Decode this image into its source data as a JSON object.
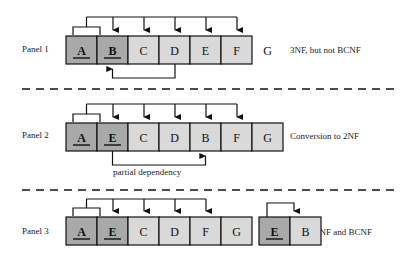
{
  "figure": {
    "colors": {
      "key_cell_fill": "#a9a9a9",
      "nonkey_cell_fill": "#d9d9d9",
      "stroke": "#111111",
      "background": "#ffffff",
      "dashed_separator": "#111111"
    }
  },
  "panels": [
    {
      "id": "panel-1",
      "label": "Panel 1",
      "note": "3NF, but not BCNF",
      "tables": [
        {
          "id": "panel1-table",
          "cells": [
            {
              "text": "A",
              "key": true,
              "underline": true
            },
            {
              "text": "B",
              "key": true,
              "underline": true
            },
            {
              "text": "C",
              "key": false,
              "underline": false
            },
            {
              "text": "D",
              "key": false,
              "underline": false
            },
            {
              "text": "E",
              "key": false,
              "underline": false
            },
            {
              "text": "F",
              "key": false,
              "underline": false
            },
            {
              "text": "G",
              "key": false,
              "underline": false
            }
          ]
        }
      ],
      "dependencies": [
        {
          "from": [
            "A",
            "B"
          ],
          "to": [
            "C",
            "D",
            "E",
            "F",
            "G"
          ],
          "side": "top",
          "kind": "composite-key-determines-nonkey"
        },
        {
          "from": [
            "E"
          ],
          "to": [
            "B"
          ],
          "side": "bottom",
          "kind": "transitive-dependency",
          "caption": ""
        }
      ]
    },
    {
      "id": "panel-2",
      "label": "Panel 2",
      "note": "Conversion to 2NF",
      "tables": [
        {
          "id": "panel2-table",
          "cells": [
            {
              "text": "A",
              "key": true,
              "underline": true
            },
            {
              "text": "E",
              "key": true,
              "underline": true
            },
            {
              "text": "C",
              "key": false,
              "underline": false
            },
            {
              "text": "D",
              "key": false,
              "underline": false
            },
            {
              "text": "B",
              "key": false,
              "underline": false
            },
            {
              "text": "F",
              "key": false,
              "underline": false
            },
            {
              "text": "G",
              "key": false,
              "underline": false
            }
          ]
        }
      ],
      "dependencies": [
        {
          "from": [
            "A",
            "E"
          ],
          "to": [
            "C",
            "D",
            "B",
            "F",
            "G"
          ],
          "side": "top",
          "kind": "composite-key-determines-nonkey"
        },
        {
          "from": [
            "E"
          ],
          "to": [
            "B"
          ],
          "side": "bottom",
          "kind": "partial-dependency",
          "caption": "partial dependency"
        }
      ]
    },
    {
      "id": "panel-3",
      "label": "Panel 3",
      "note": "3NF and BCNF",
      "tables": [
        {
          "id": "panel3-table-left",
          "cells": [
            {
              "text": "A",
              "key": true,
              "underline": true
            },
            {
              "text": "E",
              "key": true,
              "underline": true
            },
            {
              "text": "C",
              "key": false,
              "underline": false
            },
            {
              "text": "D",
              "key": false,
              "underline": false
            },
            {
              "text": "F",
              "key": false,
              "underline": false
            },
            {
              "text": "G",
              "key": false,
              "underline": false
            }
          ]
        },
        {
          "id": "panel3-table-right",
          "cells": [
            {
              "text": "E",
              "key": true,
              "underline": true
            },
            {
              "text": "B",
              "key": false,
              "underline": false
            }
          ]
        }
      ],
      "dependencies": [
        {
          "from": [
            "A",
            "E"
          ],
          "to": [
            "C",
            "D",
            "F",
            "G"
          ],
          "side": "top",
          "kind": "composite-key-determines-nonkey"
        },
        {
          "from": [
            "E"
          ],
          "to": [
            "B"
          ],
          "side": "top",
          "kind": "key-determines-nonkey"
        }
      ]
    }
  ],
  "captions": {
    "partial_dependency": "partial dependency"
  },
  "separators": [
    {
      "id": "separator-1",
      "y": 89
    },
    {
      "id": "separator-2",
      "y": 190
    }
  ]
}
